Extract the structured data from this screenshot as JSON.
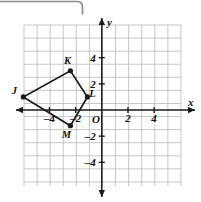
{
  "figure": {
    "kind": "coordinate-plane-quadrilateral",
    "axis_labels": {
      "x": "x",
      "y": "y",
      "origin": "O"
    },
    "x_ticks": [
      {
        "value": -4,
        "label": "–4"
      },
      {
        "value": -2,
        "label": "–2"
      },
      {
        "value": 2,
        "label": "2"
      },
      {
        "value": 4,
        "label": "4"
      }
    ],
    "y_ticks": [
      {
        "value": 4,
        "label": "4"
      },
      {
        "value": 2,
        "label": "2"
      },
      {
        "value": -2,
        "label": "–2"
      },
      {
        "value": -4,
        "label": "–4"
      }
    ],
    "grid": {
      "x_min": -6,
      "x_max": 6,
      "y_min": -5.8,
      "y_max": 6.5,
      "step": 1,
      "visible": true,
      "grid_color": "#b9b9bd",
      "axis_color": "#1a1a1a"
    },
    "vertices": [
      {
        "name": "J",
        "x": -6.0,
        "y": 1.0,
        "label_dx": -9,
        "label_dy": -3
      },
      {
        "name": "K",
        "x": -2.4,
        "y": 3.0,
        "label_dx": -3,
        "label_dy": -7
      },
      {
        "name": "L",
        "x": -1.1,
        "y": 1.0,
        "label_dx": 5,
        "label_dy": 0
      },
      {
        "name": "M",
        "x": -2.4,
        "y": -1.2,
        "label_dx": -4,
        "label_dy": 12
      }
    ],
    "polygon_order": [
      "J",
      "K",
      "L",
      "M"
    ],
    "stroke_color": "#1a1a1a",
    "point_color": "#1a1a1a"
  },
  "decorations": {
    "corner_frame": {
      "name": "rounded-frame-corner",
      "color": "#8a8a8f"
    }
  },
  "chart_data": {
    "type": "scatter",
    "title": "",
    "xlabel": "x",
    "ylabel": "y",
    "xlim": [
      -6,
      6
    ],
    "ylim": [
      -5.8,
      6.5
    ],
    "grid": true,
    "x_tick_labels": [
      "–4",
      "–2",
      "2",
      "4"
    ],
    "y_tick_labels": [
      "4",
      "2",
      "–2",
      "–4"
    ],
    "annotations": [
      "J",
      "K",
      "L",
      "M",
      "O"
    ],
    "series": [
      {
        "name": "Quadrilateral JKLM",
        "points": [
          {
            "label": "J",
            "x": -6.0,
            "y": 1.0
          },
          {
            "label": "K",
            "x": -2.4,
            "y": 3.0
          },
          {
            "label": "L",
            "x": -1.1,
            "y": 1.0
          },
          {
            "label": "M",
            "x": -2.4,
            "y": -1.2
          }
        ],
        "closed": true
      }
    ]
  }
}
